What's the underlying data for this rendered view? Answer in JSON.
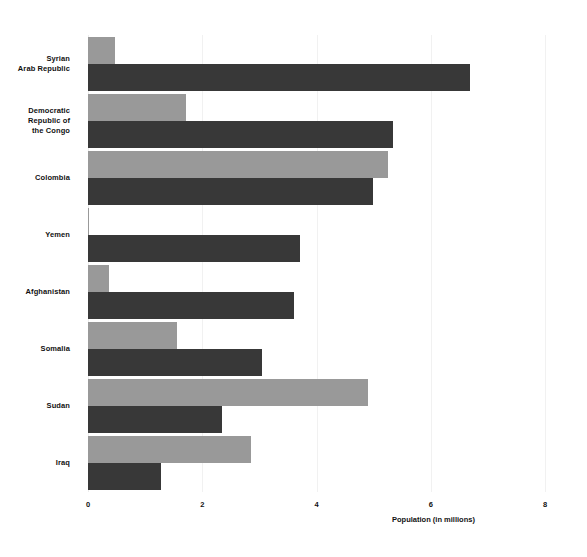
{
  "chart_data": {
    "type": "bar",
    "orientation": "horizontal",
    "title": "",
    "xlabel": "Population (in millions)",
    "ylabel": "",
    "xlim": [
      0,
      8
    ],
    "xticks": [
      "0",
      "2",
      "4",
      "6",
      "8"
    ],
    "grid": true,
    "legend": "none",
    "categories": [
      "Syrian\nArab Republic",
      "Democratic\nRepublic of\nthe Congo",
      "Colombia",
      "Yemen",
      "Afghanistan",
      "Somalia",
      "Sudan",
      "Iraq"
    ],
    "categories_flat": [
      "Syrian Arab Republic",
      "Democratic Republic of the Congo",
      "Colombia",
      "Yemen",
      "Afghanistan",
      "Somalia",
      "Sudan",
      "Iraq"
    ],
    "series": [
      {
        "name": "series-1",
        "color": "#999999",
        "values": [
          0.47,
          1.72,
          5.25,
          0.02,
          0.37,
          1.55,
          4.9,
          2.85
        ]
      },
      {
        "name": "series-2",
        "color": "#383838",
        "values": [
          6.69,
          5.34,
          4.99,
          3.71,
          3.6,
          3.05,
          2.35,
          1.28
        ]
      }
    ]
  },
  "colors": {
    "background": "#ffffff",
    "grid": "#f1f1f1",
    "text": "#111111",
    "series_1": "#999999",
    "series_2": "#383838"
  }
}
